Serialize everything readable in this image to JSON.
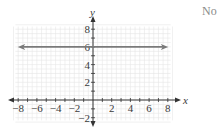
{
  "answer_label": "No",
  "chart_data": {
    "type": "line",
    "title": "",
    "xlabel": "x",
    "ylabel": "y",
    "xlim": [
      -8,
      8
    ],
    "ylim": [
      -2,
      8
    ],
    "grid": true,
    "x_ticks": [
      -8,
      -6,
      -4,
      -2,
      2,
      4,
      6,
      8
    ],
    "y_ticks": [
      -2,
      2,
      4,
      6,
      8
    ],
    "series": [
      {
        "name": "y = 6",
        "equation": "y = 6",
        "x": [
          -8,
          8
        ],
        "y": [
          6,
          6
        ],
        "arrows": "both"
      }
    ],
    "colors": {
      "axes": "#333333",
      "line": "#7a7a7a",
      "grid": "#e6e6e6",
      "text": "#3a3a3a"
    }
  }
}
